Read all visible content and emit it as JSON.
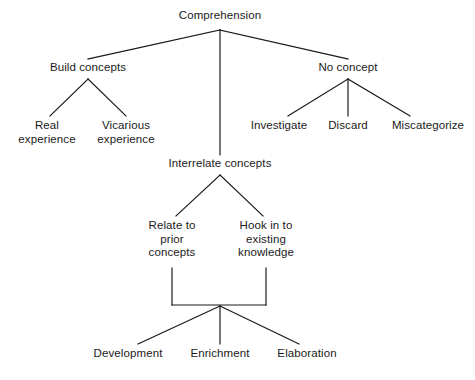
{
  "diagram": {
    "type": "tree-diagram",
    "title": "Comprehension",
    "background_color": "#ffffff",
    "line_color": "#1a1a1a",
    "text_color": "#1a1a1a",
    "nodes": [
      {
        "id": "comprehension",
        "label": "Comprehension",
        "cx": 220,
        "top": 9,
        "level": 0
      },
      {
        "id": "build-concepts",
        "label": "Build concepts",
        "cx": 88,
        "top": 61,
        "level": 1
      },
      {
        "id": "interrelate-concepts",
        "label": "Interrelate concepts",
        "cx": 220,
        "top": 157,
        "level": 1
      },
      {
        "id": "no-concept",
        "label": "No concept",
        "cx": 348,
        "top": 61,
        "level": 1
      },
      {
        "id": "real-experience",
        "label": "Real\nexperience",
        "cx": 47,
        "top": 119,
        "level": 2
      },
      {
        "id": "vicarious-experience",
        "label": "Vicarious\nexperience",
        "cx": 126,
        "top": 119,
        "level": 2
      },
      {
        "id": "investigate",
        "label": "Investigate",
        "cx": 279,
        "top": 119,
        "level": 2
      },
      {
        "id": "discard",
        "label": "Discard",
        "cx": 348,
        "top": 119,
        "level": 2
      },
      {
        "id": "miscategorize",
        "label": "Miscategorize",
        "cx": 428,
        "top": 119,
        "level": 2
      },
      {
        "id": "relate-to-prior",
        "label": "Relate to\nprior\nconcepts",
        "cx": 172,
        "top": 219,
        "level": 2
      },
      {
        "id": "hook-in-to-existing",
        "label": "Hook in to\nexisting\nknowledge",
        "cx": 266,
        "top": 219,
        "level": 2
      },
      {
        "id": "development",
        "label": "Development",
        "cx": 128,
        "top": 347,
        "level": 3
      },
      {
        "id": "enrichment",
        "label": "Enrichment",
        "cx": 220,
        "top": 347,
        "level": 3
      },
      {
        "id": "elaboration",
        "label": "Elaboration",
        "cx": 307,
        "top": 347,
        "level": 3
      }
    ],
    "edges": [
      {
        "id": "comprehension-to-build-concepts",
        "from": "comprehension",
        "to": "build-concepts",
        "x1": 220,
        "y1": 30,
        "x2": 88,
        "y2": 59
      },
      {
        "id": "comprehension-to-interrelate-concepts",
        "from": "comprehension",
        "to": "interrelate-concepts",
        "x1": 220,
        "y1": 30,
        "x2": 220,
        "y2": 155
      },
      {
        "id": "comprehension-to-no-concept",
        "from": "comprehension",
        "to": "no-concept",
        "x1": 220,
        "y1": 30,
        "x2": 348,
        "y2": 59
      },
      {
        "id": "build-concepts-to-real-experience",
        "from": "build-concepts",
        "to": "real-experience",
        "x1": 88,
        "y1": 79,
        "x2": 50,
        "y2": 116
      },
      {
        "id": "build-concepts-to-vicarious-experience",
        "from": "build-concepts",
        "to": "vicarious-experience",
        "x1": 88,
        "y1": 79,
        "x2": 126,
        "y2": 116
      },
      {
        "id": "no-concept-to-investigate",
        "from": "no-concept",
        "to": "investigate",
        "x1": 348,
        "y1": 79,
        "x2": 288,
        "y2": 116
      },
      {
        "id": "no-concept-to-discard",
        "from": "no-concept",
        "to": "discard",
        "x1": 348,
        "y1": 79,
        "x2": 348,
        "y2": 116
      },
      {
        "id": "no-concept-to-miscategorize",
        "from": "no-concept",
        "to": "miscategorize",
        "x1": 348,
        "y1": 79,
        "x2": 410,
        "y2": 116
      },
      {
        "id": "interrelate-to-relate-to-prior",
        "from": "interrelate-concepts",
        "to": "relate-to-prior",
        "x1": 220,
        "y1": 175,
        "x2": 176,
        "y2": 216
      },
      {
        "id": "interrelate-to-hook-in-to-existing",
        "from": "interrelate-concepts",
        "to": "hook-in-to-existing",
        "x1": 220,
        "y1": 175,
        "x2": 263,
        "y2": 216
      },
      {
        "id": "relate-to-prior-down-stem",
        "from": "relate-to-prior",
        "to": "merge-bar",
        "x1": 172,
        "y1": 268,
        "x2": 172,
        "y2": 305
      },
      {
        "id": "hook-in-to-existing-down-stem",
        "from": "hook-in-to-existing",
        "to": "merge-bar",
        "x1": 266,
        "y1": 268,
        "x2": 266,
        "y2": 305
      },
      {
        "id": "merge-bar-horizontal",
        "from": "merge-bar",
        "to": "merge-bar",
        "x1": 172,
        "y1": 305,
        "x2": 266,
        "y2": 305
      },
      {
        "id": "merge-to-development",
        "from": "merge-bar",
        "to": "development",
        "x1": 220,
        "y1": 306,
        "x2": 138,
        "y2": 344
      },
      {
        "id": "merge-to-enrichment",
        "from": "merge-bar",
        "to": "enrichment",
        "x1": 220,
        "y1": 306,
        "x2": 220,
        "y2": 344
      },
      {
        "id": "merge-to-elaboration",
        "from": "merge-bar",
        "to": "elaboration",
        "x1": 220,
        "y1": 306,
        "x2": 299,
        "y2": 344
      }
    ]
  }
}
